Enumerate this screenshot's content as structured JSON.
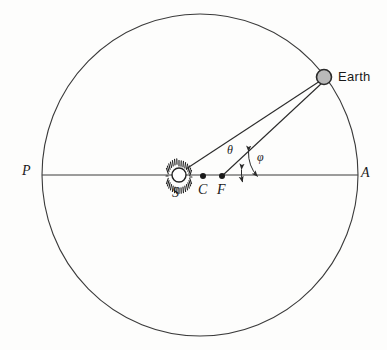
{
  "figure": {
    "type": "orbital-geometry-diagram",
    "title": "",
    "background_color": "#fdfdfc",
    "stroke_color": "#2a2a2a"
  },
  "orbit": {
    "name": "elliptical-orbit-path",
    "center": {
      "x": 200,
      "y": 175
    },
    "semi_major_axis_px": 158,
    "semi_minor_axis_px": 161,
    "stroke_color": "#3a3a3a",
    "stroke_width": 1
  },
  "axis": {
    "name": "apse-line",
    "from": {
      "x": 42,
      "y": 175
    },
    "to": {
      "x": 358,
      "y": 175
    },
    "stroke_color": "#3a3a3a"
  },
  "bodies": {
    "sun": {
      "label": "S",
      "center": {
        "x": 179,
        "y": 175
      },
      "radius_px": 7,
      "ray_count": 28,
      "color": "#222222",
      "label_offset": {
        "x": -5,
        "y": 16
      }
    },
    "earth": {
      "label": "Earth",
      "center": {
        "x": 324,
        "y": 77
      },
      "radius_px": 7,
      "fill_color": "#b9b9b9",
      "stroke_color": "#2a2a2a",
      "label_offset": {
        "x": 14,
        "y": 5
      }
    }
  },
  "points": [
    {
      "label": "C",
      "name": "ellipse-center-point",
      "x": 203,
      "y": 176,
      "dot_radius_px": 3,
      "label_dx": -4,
      "label_dy": 17
    },
    {
      "label": "F",
      "name": "focus-point",
      "x": 222,
      "y": 176,
      "dot_radius_px": 3,
      "label_dx": -4,
      "label_dy": 17
    }
  ],
  "apse_labels": [
    {
      "label": "P",
      "name": "perihelion-label",
      "x": 27,
      "y": 173
    },
    {
      "label": "A",
      "name": "aphelion-label",
      "x": 364,
      "y": 176
    }
  ],
  "radii": [
    {
      "name": "center-to-earth-line",
      "from": {
        "x": 186,
        "y": 169
      },
      "to": {
        "x": 320,
        "y": 81
      },
      "stroke_width": 1
    },
    {
      "name": "focus-to-earth-line",
      "from": {
        "x": 222,
        "y": 176
      },
      "to": {
        "x": 322,
        "y": 83
      },
      "stroke_width": 1
    }
  ],
  "angles": [
    {
      "symbol": "θ",
      "name": "eccentric-anomaly",
      "label_x": 231,
      "label_y": 152,
      "arc_vertex": {
        "x": 203,
        "y": 176
      },
      "arc_radius_px": 40,
      "start_deg": 0,
      "end_deg": 33
    },
    {
      "symbol": "φ",
      "name": "true-anomaly",
      "label_x": 261,
      "label_y": 159,
      "arc_vertex": {
        "x": 222,
        "y": 176
      },
      "arc_radius_px": 36,
      "start_deg": 0,
      "end_deg": 43
    }
  ]
}
